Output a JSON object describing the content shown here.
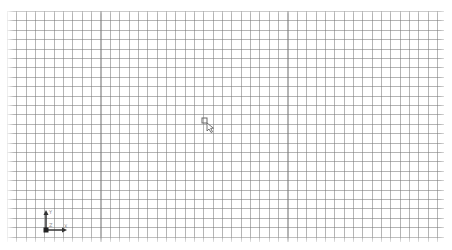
{
  "viewport": {
    "type": "2d-cad-sketch-canvas",
    "background_color": "#ffffff",
    "grid": {
      "line_color": "#8a8a8a",
      "spacing_px": 9.4,
      "visible": true
    }
  },
  "axis_indicator": {
    "x_label": "X",
    "y_label": "Y",
    "origin_label": "Z",
    "axis_color": "#333333"
  },
  "cursor": {
    "type": "pointer-with-snap-box"
  }
}
